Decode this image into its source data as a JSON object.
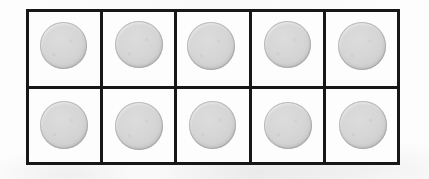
{
  "image": {
    "kind": "scanned-photograph",
    "subject": "grid-of-circular-discs",
    "background_color": "#fdfdfd"
  },
  "grid": {
    "rows": 2,
    "columns": 5,
    "total_cells": 10,
    "border_color": "#171717",
    "border_width_px": 3,
    "cell_background": "#fdfdfd",
    "cells": [
      {
        "row": 1,
        "column": 1,
        "shape": "circle",
        "fill_color": "#d6d6d6",
        "rim_color": "#b4b4b4"
      },
      {
        "row": 1,
        "column": 2,
        "shape": "circle",
        "fill_color": "#d6d6d6",
        "rim_color": "#b4b4b4"
      },
      {
        "row": 1,
        "column": 3,
        "shape": "circle",
        "fill_color": "#d6d6d6",
        "rim_color": "#b4b4b4"
      },
      {
        "row": 1,
        "column": 4,
        "shape": "circle",
        "fill_color": "#d6d6d6",
        "rim_color": "#b4b4b4"
      },
      {
        "row": 1,
        "column": 5,
        "shape": "circle",
        "fill_color": "#d6d6d6",
        "rim_color": "#b4b4b4"
      },
      {
        "row": 2,
        "column": 1,
        "shape": "circle",
        "fill_color": "#d6d6d6",
        "rim_color": "#b4b4b4"
      },
      {
        "row": 2,
        "column": 2,
        "shape": "circle",
        "fill_color": "#d6d6d6",
        "rim_color": "#b4b4b4"
      },
      {
        "row": 2,
        "column": 3,
        "shape": "circle",
        "fill_color": "#d6d6d6",
        "rim_color": "#b4b4b4"
      },
      {
        "row": 2,
        "column": 4,
        "shape": "circle",
        "fill_color": "#d6d6d6",
        "rim_color": "#b4b4b4"
      },
      {
        "row": 2,
        "column": 5,
        "shape": "circle",
        "fill_color": "#d6d6d6",
        "rim_color": "#b4b4b4"
      }
    ]
  }
}
